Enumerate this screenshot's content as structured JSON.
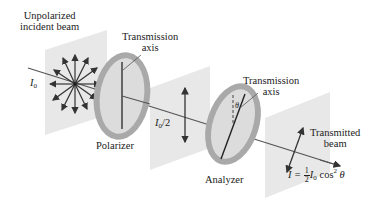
{
  "diagram": {
    "type": "polarization of light through polarizer and analyzer",
    "labels": {
      "unpolarized_line1": "Unpolarized",
      "unpolarized_line2": "incident beam",
      "incident_intensity": "I",
      "incident_intensity_sub": "0",
      "trans_axis_1_line1": "Transmission",
      "trans_axis_1_line2": "axis",
      "polarizer": "Polarizer",
      "half_intensity": "I",
      "half_intensity_sub": "0",
      "half_intensity_suffix": "/2",
      "trans_axis_2_line1": "Transmission",
      "trans_axis_2_line2": "axis",
      "theta": "θ",
      "analyzer": "Analyzer",
      "transmitted_line1": "Transmitted",
      "transmitted_line2": "beam",
      "malus_lhs": "I = ",
      "malus_frac_num": "1",
      "malus_frac_den": "2",
      "malus_I": "I",
      "malus_I_sub": "0",
      "malus_rhs": " cos",
      "malus_exp": "2",
      "malus_theta": " θ"
    },
    "colors": {
      "plane": "#e6e6e6",
      "ring": "#a9a9a9",
      "disk": "#dcdcdc",
      "beam": "#444444",
      "arrow": "#333333"
    }
  }
}
